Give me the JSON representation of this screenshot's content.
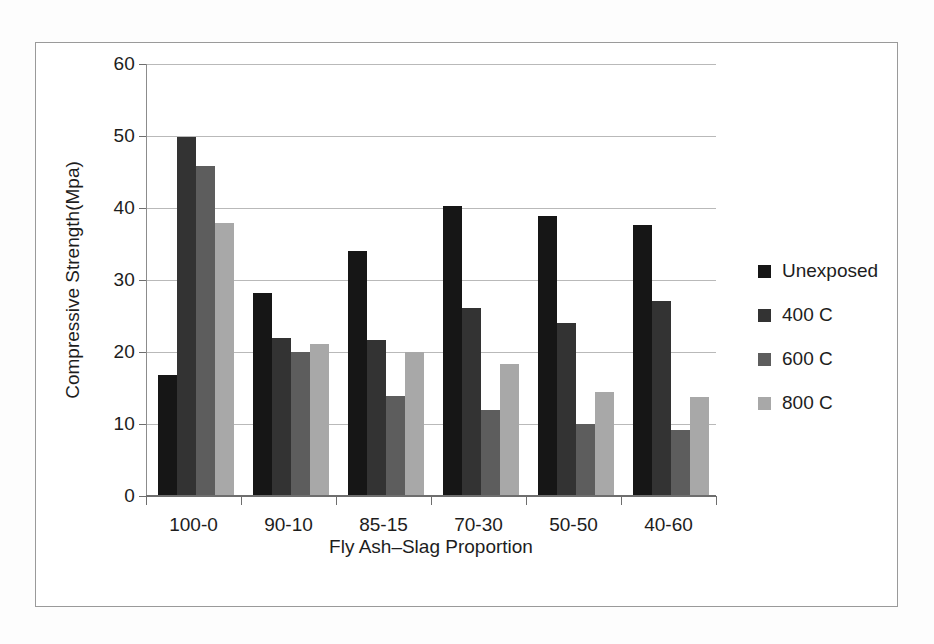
{
  "chart_data": {
    "type": "bar",
    "title": "",
    "xlabel": "Fly Ash–Slag Proportion",
    "ylabel": "Compressive Strength(Mpa)",
    "categories": [
      "100-0",
      "90-10",
      "85-15",
      "70-30",
      "50-50",
      "40-60"
    ],
    "series": [
      {
        "name": "Unexposed",
        "color": "#161616",
        "values": [
          16.8,
          28.2,
          34.0,
          40.3,
          38.9,
          37.7
        ]
      },
      {
        "name": "400 C",
        "color": "#333333",
        "values": [
          49.8,
          22.0,
          21.6,
          26.1,
          24.0,
          27.1
        ]
      },
      {
        "name": "600 C",
        "color": "#5d5d5d",
        "values": [
          45.8,
          20.0,
          13.9,
          11.9,
          10.0,
          9.2
        ]
      },
      {
        "name": "800 C",
        "color": "#a8a8a8",
        "values": [
          37.9,
          21.1,
          20.0,
          18.4,
          14.4,
          13.7
        ]
      }
    ],
    "ylim": [
      0,
      60
    ],
    "yticks": [
      0,
      10,
      20,
      30,
      40,
      50,
      60
    ],
    "ytick_labels": [
      "0",
      "10",
      "20",
      "30",
      "40",
      "50",
      "60"
    ],
    "grid": true,
    "grid_axis": "y",
    "legend_position": "right",
    "legend_entries": [
      "Unexposed",
      "400 C",
      "600 C",
      "800 C"
    ]
  }
}
